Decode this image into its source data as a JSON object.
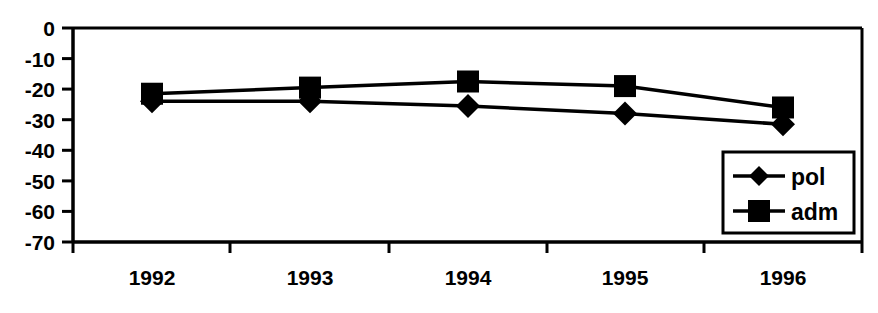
{
  "chart_data": {
    "type": "line",
    "title": "",
    "xlabel": "",
    "ylabel": "",
    "categories": [
      "1992",
      "1993",
      "1994",
      "1995",
      "1996"
    ],
    "series": [
      {
        "name": "pol",
        "marker": "diamond",
        "values": [
          -24,
          -24,
          -25.5,
          -28,
          -31.5
        ]
      },
      {
        "name": "adm",
        "marker": "square",
        "values": [
          -21.5,
          -19.5,
          -17.5,
          -19,
          -26
        ]
      }
    ],
    "ylim": [
      -70,
      0
    ],
    "yticks": [
      0,
      -10,
      -20,
      -30,
      -40,
      -50,
      -60,
      -70
    ],
    "ytick_labels": [
      "0",
      "-10",
      "-20",
      "-30",
      "-40",
      "-50",
      "-60",
      "-70"
    ],
    "grid": false,
    "legend_position": "bottom-right",
    "colors": {
      "line": "#000000",
      "marker": "#000000",
      "axis": "#000000",
      "background": "#ffffff"
    }
  },
  "legend": {
    "entries": [
      {
        "label": "pol",
        "marker": "diamond-marker"
      },
      {
        "label": "adm",
        "marker": "square-marker"
      }
    ]
  }
}
